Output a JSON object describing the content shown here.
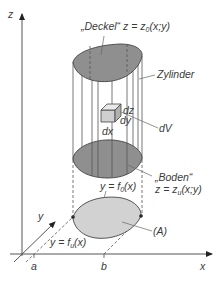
{
  "figure": {
    "axes": {
      "z_label": "z",
      "y_label": "y",
      "x_label": "x",
      "a_label": "a",
      "b_label": "b"
    },
    "labels": {
      "deckel_name": "„Deckel“",
      "deckel_eq_prefix": "z = z",
      "deckel_eq_sub": "0",
      "deckel_eq_suffix": "(x;y)",
      "zylinder": "Zylinder",
      "dz": "dz",
      "dy": "dy",
      "dx": "dx",
      "dV": "dV",
      "boden_name": "„Boden“",
      "boden_eq_prefix": "z = z",
      "boden_eq_sub": "u",
      "boden_eq_suffix": "(x;y)",
      "upper_curve_prefix": "y = f",
      "upper_curve_sub": "0",
      "upper_curve_suffix": "(x)",
      "lower_curve_prefix": "y = f",
      "lower_curve_sub": "u",
      "lower_curve_suffix": "(x)",
      "region": "(A)"
    },
    "colors": {
      "lid": "#8f8f8f",
      "footprint": "#d2d2d2",
      "cube_front": "#cfcfcf",
      "cube_top": "#e8e8e8",
      "cube_side": "#b0b0b0",
      "line": "#555555"
    }
  }
}
